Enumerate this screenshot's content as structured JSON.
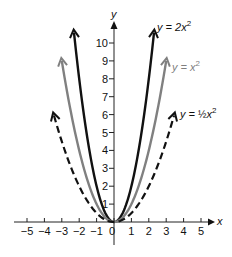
{
  "chart_data": {
    "type": "line",
    "title": "",
    "xlabel": "x",
    "ylabel": "y",
    "xlim": [
      -5,
      5
    ],
    "ylim": [
      0,
      10
    ],
    "x_ticks": [
      -5,
      -4,
      -3,
      -2,
      -1,
      0,
      1,
      2,
      3,
      4,
      5
    ],
    "x_tick_labels": [
      "−5",
      "−4",
      "−3",
      "−2",
      "−1",
      "0",
      "1",
      "2",
      "3",
      "4",
      "5"
    ],
    "y_ticks": [
      1,
      2,
      3,
      4,
      5,
      6,
      7,
      8,
      9,
      10
    ],
    "y_tick_labels": [
      "1",
      "2",
      "3",
      "4",
      "5",
      "6",
      "7",
      "8",
      "9",
      "10"
    ],
    "grid": false,
    "legend": "inline labels at curve ends (top right)",
    "series": [
      {
        "name": "y = 2x²",
        "formula": "2x^2",
        "coef": 2,
        "x_range": [
          -2.3,
          2.3
        ],
        "color": "#111111",
        "style": "solid",
        "label": {
          "prefix": "y = 2x",
          "exp": "2"
        }
      },
      {
        "name": "y = x²",
        "formula": "x^2",
        "coef": 1,
        "x_range": [
          -3,
          3
        ],
        "color": "#808080",
        "style": "solid",
        "label": {
          "prefix": "y = x",
          "exp": "2"
        }
      },
      {
        "name": "y = ½x²",
        "formula": "0.5x^2",
        "coef": 0.5,
        "x_range": [
          -3.45,
          3.45
        ],
        "color": "#111111",
        "style": "dashed",
        "label": {
          "prefix": "y = ",
          "frac": "½",
          "suffix": "x",
          "exp": "2"
        }
      }
    ]
  }
}
